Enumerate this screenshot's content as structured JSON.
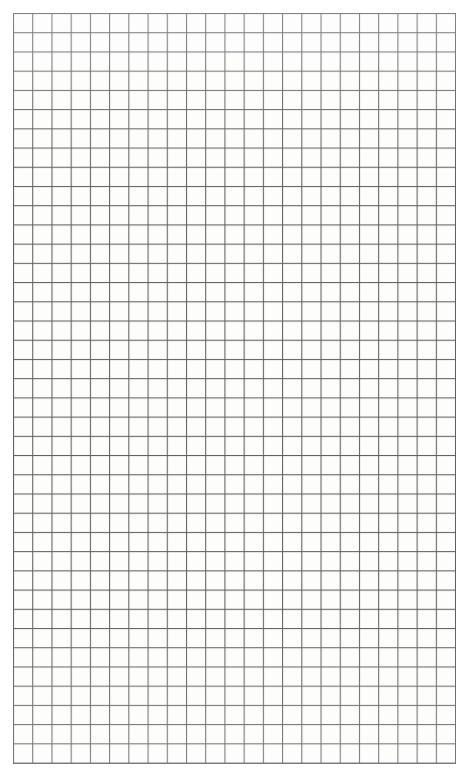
{
  "page": {
    "width": 469,
    "height": 781,
    "background_color": "#ffffff",
    "kind": "grid-paper-sheet"
  },
  "sheet": {
    "left": 13,
    "top": 13,
    "width": 442,
    "height": 757,
    "paper_color": "#fdfdfc",
    "line_color": "#5c5c5c",
    "line_width_px": 1,
    "cell_size_px": 19.22,
    "columns": 23,
    "rows": 39,
    "has_major_gridlines": false,
    "has_labels": false,
    "content_text": ""
  },
  "margin": {
    "color": "#ffffff",
    "left": 13,
    "top": 13,
    "right": 14,
    "bottom": 11
  }
}
